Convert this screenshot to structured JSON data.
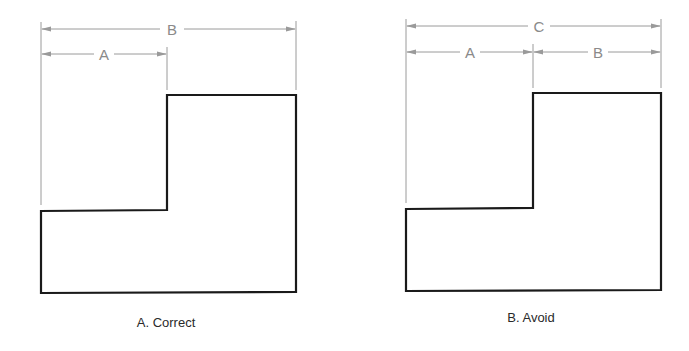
{
  "figures": [
    {
      "id": "correct",
      "caption": "A. Correct",
      "dimensions": [
        {
          "label": "B",
          "from": "left-edge",
          "to": "right-edge",
          "level": 1
        },
        {
          "label": "A",
          "from": "left-edge",
          "to": "step-edge",
          "level": 2
        }
      ]
    },
    {
      "id": "avoid",
      "caption": "B. Avoid",
      "dimensions": [
        {
          "label": "C",
          "from": "left-edge",
          "to": "right-edge",
          "level": 1
        },
        {
          "label": "A",
          "from": "left-edge",
          "to": "step-edge",
          "level": 2
        },
        {
          "label": "B",
          "from": "step-edge",
          "to": "right-edge",
          "level": 2
        }
      ]
    }
  ],
  "colors": {
    "outline": "#1a1a1a",
    "dimension_lines": "#9a9a9a",
    "dimension_text": "#8a8a8a",
    "caption_text": "#2a2a2a"
  }
}
